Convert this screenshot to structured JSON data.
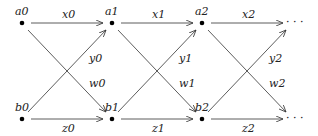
{
  "diagram": {
    "type": "lattice-graph",
    "nodes": [
      {
        "id": "a0",
        "label": "a0",
        "x": 22,
        "y": 23
      },
      {
        "id": "a1",
        "label": "a1",
        "x": 112,
        "y": 23
      },
      {
        "id": "a2",
        "label": "a2",
        "x": 202,
        "y": 23
      },
      {
        "id": "b0",
        "label": "b0",
        "x": 22,
        "y": 119
      },
      {
        "id": "b1",
        "label": "b1",
        "x": 112,
        "y": 119
      },
      {
        "id": "b2",
        "label": "b2",
        "x": 202,
        "y": 119
      }
    ],
    "continuation_top": "· · ·",
    "continuation_bottom": "· · ·",
    "edges": [
      {
        "from": "a0",
        "to": "a1",
        "label": "x0"
      },
      {
        "from": "a1",
        "to": "a2",
        "label": "x1"
      },
      {
        "from": "a2",
        "to": "...",
        "label": "x2"
      },
      {
        "from": "b0",
        "to": "b1",
        "label": "z0"
      },
      {
        "from": "b1",
        "to": "b2",
        "label": "z1"
      },
      {
        "from": "b2",
        "to": "...",
        "label": "z2"
      },
      {
        "from": "b0",
        "to": "a1",
        "label": "y0"
      },
      {
        "from": "b1",
        "to": "a2",
        "label": "y1"
      },
      {
        "from": "b2",
        "to": "...",
        "label": "y2"
      },
      {
        "from": "a0",
        "to": "b1",
        "label": "w0"
      },
      {
        "from": "a1",
        "to": "b2",
        "label": "w1"
      },
      {
        "from": "a2",
        "to": "...",
        "label": "w2"
      }
    ]
  }
}
